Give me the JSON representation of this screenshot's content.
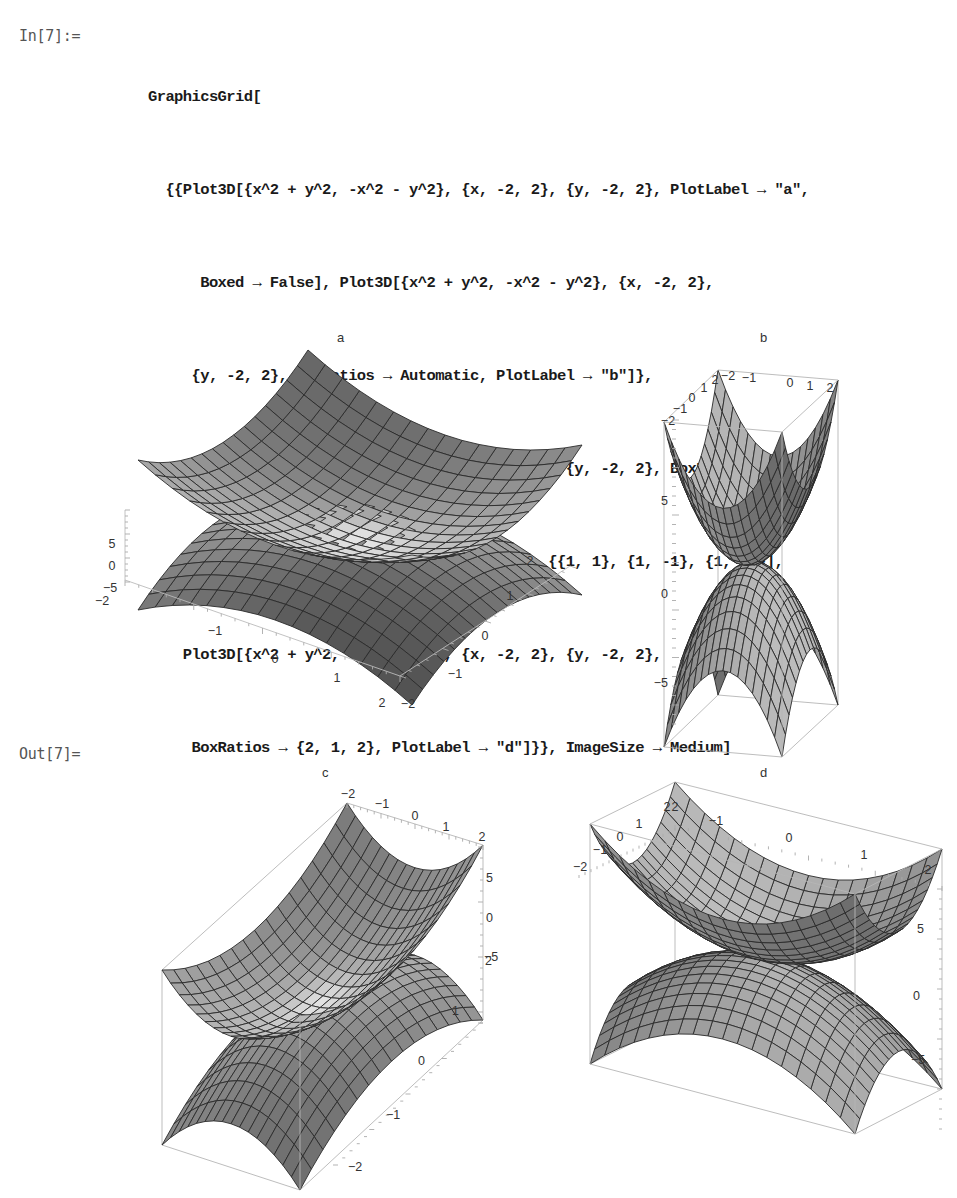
{
  "notebook": {
    "input_label": "In[7]:=",
    "output_label": "Out[7]=",
    "code_lines": [
      "GraphicsGrid[",
      "  {{Plot3D[{x^2 + y^2, -x^2 - y^2}, {x, -2, 2}, {y, -2, 2}, PlotLabel → \"a\",",
      "      Boxed → False], Plot3D[{x^2 + y^2, -x^2 - y^2}, {x, -2, 2},",
      "     {y, -2, 2}, BoxRatios → Automatic, PlotLabel → \"b\"]},",
      "   {Plot3D[{x^2 + y^2, -x^2 - y^2}, {x, -2, 2}, {y, -2, 2}, BoxRatios →",
      "       {1, 2, 1}, PlotLabel → \"c\", AxesEdge → {{1, 1}, {1, -1}, {1, 1}}],",
      "    Plot3D[{x^2 + y^2, -x^2 - y^2}, {x, -2, 2}, {y, -2, 2},",
      "     BoxRatios → {2, 1, 2}, PlotLabel → \"d\"]}}, ImageSize → Medium]"
    ]
  },
  "chart_data": [
    {
      "type": "surface3d",
      "title": "a",
      "functions": [
        "x^2 + y^2",
        "-x^2 - y^2"
      ],
      "x_range": [
        -2,
        2
      ],
      "y_range": [
        -2,
        2
      ],
      "z_range": [
        -8,
        8
      ],
      "boxed": false,
      "box_ratios": [
        1,
        1,
        0.4
      ],
      "x_ticks": [
        "-2",
        "-1",
        "0",
        "1",
        "2"
      ],
      "y_ticks": [
        "-2",
        "-1",
        "0",
        "1",
        "2"
      ],
      "z_ticks": [
        "5",
        "0",
        "-5"
      ]
    },
    {
      "type": "surface3d",
      "title": "b",
      "functions": [
        "x^2 + y^2",
        "-x^2 - y^2"
      ],
      "x_range": [
        -2,
        2
      ],
      "y_range": [
        -2,
        2
      ],
      "z_range": [
        -8,
        8
      ],
      "boxed": true,
      "box_ratios": "Automatic",
      "x_ticks": [
        "-2",
        "-1",
        "0",
        "1",
        "2"
      ],
      "y_ticks": [
        "-2",
        "-1",
        "0",
        "1",
        "2"
      ],
      "z_ticks": [
        "5",
        "0",
        "-5"
      ]
    },
    {
      "type": "surface3d",
      "title": "c",
      "functions": [
        "x^2 + y^2",
        "-x^2 - y^2"
      ],
      "x_range": [
        -2,
        2
      ],
      "y_range": [
        -2,
        2
      ],
      "z_range": [
        -8,
        8
      ],
      "boxed": true,
      "box_ratios": [
        1,
        2,
        1
      ],
      "axes_edge": [
        [
          1,
          1
        ],
        [
          1,
          -1
        ],
        [
          1,
          1
        ]
      ],
      "x_ticks": [
        "-2",
        "-1",
        "0",
        "1",
        "2"
      ],
      "y_ticks": [
        "2",
        "1",
        "0",
        "-1",
        "-2"
      ],
      "z_ticks": [
        "5",
        "0",
        "-5"
      ]
    },
    {
      "type": "surface3d",
      "title": "d",
      "functions": [
        "x^2 + y^2",
        "-x^2 - y^2"
      ],
      "x_range": [
        -2,
        2
      ],
      "y_range": [
        -2,
        2
      ],
      "z_range": [
        -8,
        8
      ],
      "boxed": true,
      "box_ratios": [
        2,
        1,
        2
      ],
      "x_ticks": [
        "2",
        "-1",
        "0",
        "1",
        "2"
      ],
      "y_ticks": [
        "-2",
        "-1",
        "0",
        "1",
        "2"
      ],
      "z_ticks": [
        "5",
        "0",
        "-5"
      ]
    }
  ],
  "plots": {
    "a": {
      "label": "a"
    },
    "b": {
      "label": "b"
    },
    "c": {
      "label": "c"
    },
    "d": {
      "label": "d"
    }
  }
}
